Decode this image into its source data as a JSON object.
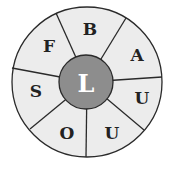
{
  "puzzle": {
    "type": "word-wheel",
    "center_letter": "L",
    "segments": [
      {
        "letter": "B"
      },
      {
        "letter": "A"
      },
      {
        "letter": "U"
      },
      {
        "letter": "U"
      },
      {
        "letter": "O"
      },
      {
        "letter": "S"
      },
      {
        "letter": "F"
      }
    ],
    "colors": {
      "segment_fill": "#ececec",
      "hub_fill": "#8d8d8d",
      "hub_text": "#ffffff",
      "stroke": "#2a2a2a"
    }
  }
}
